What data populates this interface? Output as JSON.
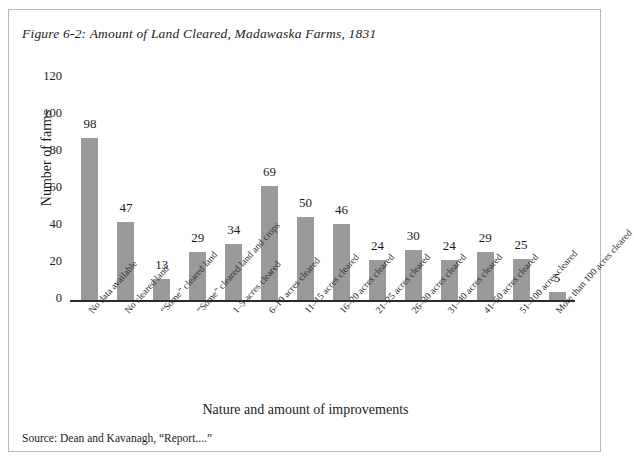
{
  "figure": {
    "title": "Figure 6-2: Amount of Land Cleared, Madawaska Farms, 1831",
    "source": "Source: Dean and Kavanagh, “Report....”",
    "frame_color": "#b9b9b9",
    "background": "#ffffff"
  },
  "chart_data": {
    "type": "bar",
    "title": "Figure 6-2: Amount of Land Cleared, Madawaska Farms, 1831",
    "xlabel": "Nature and amount of improvements",
    "ylabel": "Number of farms",
    "ylim": [
      0,
      120
    ],
    "yticks": [
      0,
      20,
      40,
      60,
      80,
      100,
      120
    ],
    "grid": false,
    "legend": null,
    "bar_color": "#9a9a9a",
    "categories": [
      "No data available",
      "No cleared land",
      "“Some” cleared land",
      "“Some” cleared land and crops",
      "1–5 acres cleared",
      "6–10 acres cleared",
      "11–15 acres cleared",
      "16–20 acres cleared",
      "21–25 acres cleared",
      "26–30 acres cleared",
      "31–40 acres cleared",
      "41–50 acres cleared",
      "51–100 acres cleared",
      "More than 100 acres cleared"
    ],
    "values": [
      98,
      47,
      13,
      29,
      34,
      69,
      50,
      46,
      24,
      30,
      24,
      29,
      25,
      5
    ],
    "labels": [
      "98",
      "47",
      "13",
      "29",
      "34",
      "69",
      "50",
      "46",
      "24",
      "30",
      "24",
      "29",
      "25",
      "5"
    ]
  }
}
